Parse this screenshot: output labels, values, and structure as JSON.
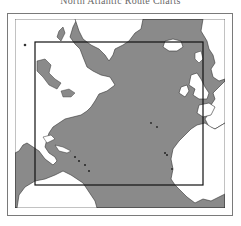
{
  "title": "North Atlantic Route Charts",
  "map": {
    "ocean_color": "#8a8a8a",
    "land_color": "#ffffff",
    "coverage_box": "route-chart-coverage-area",
    "regions": [
      "North America",
      "Greenland",
      "Iceland",
      "British Isles",
      "Scandinavia",
      "Europe",
      "Africa",
      "South America",
      "Caribbean"
    ]
  }
}
